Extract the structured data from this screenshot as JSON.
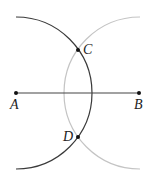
{
  "diagram": {
    "points": {
      "A": {
        "label": "A",
        "x": 16,
        "y": 93
      },
      "B": {
        "label": "B",
        "x": 139,
        "y": 93
      },
      "C": {
        "label": "C",
        "x": 78,
        "y": 50
      },
      "D": {
        "label": "D",
        "x": 78,
        "y": 137
      }
    },
    "segments": [
      {
        "from": "A",
        "to": "B",
        "color": "#444444"
      }
    ],
    "arcs": [
      {
        "center": "A",
        "radius": 75.5,
        "color": "#3a3a3a",
        "through": [
          "C",
          "D"
        ]
      },
      {
        "center": "B",
        "radius": 75.5,
        "color": "#bdbdbd",
        "through": [
          "C",
          "D"
        ]
      }
    ],
    "colors": {
      "dark_arc": "#3a3a3a",
      "light_arc": "#bdbdbd",
      "segment": "#444444",
      "point": "#111111",
      "label": "#222222"
    }
  }
}
